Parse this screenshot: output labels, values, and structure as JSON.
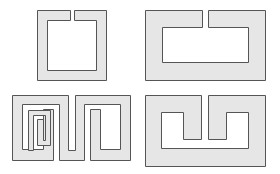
{
  "figure": {
    "fill_color": "#e6e6e6",
    "stroke_color": "#555555",
    "background": "#ffffff"
  },
  "shapes": [
    {
      "id": "square-split-ring",
      "position": "top-left"
    },
    {
      "id": "wide-split-ring",
      "position": "top-right"
    },
    {
      "id": "meander-split-ring",
      "position": "bottom-left"
    },
    {
      "id": "folded-split-ring",
      "position": "bottom-right"
    }
  ]
}
